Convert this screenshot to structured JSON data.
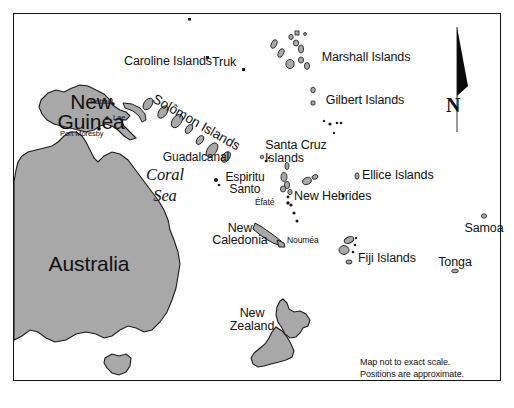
{
  "map": {
    "title_note_line1": "Map not to exact scale.",
    "title_note_line2": "Positions are approximate.",
    "compass_label": "N",
    "colors": {
      "land_fill": "#a8a8a8",
      "land_stroke": "#1a1a1a",
      "border": "#111111",
      "background": "#ffffff",
      "text": "#111111"
    },
    "sea_labels": [
      {
        "name": "coral-sea",
        "line1": "Coral",
        "line2": "Sea"
      }
    ],
    "landmasses": [
      {
        "name": "australia",
        "label": "Australia"
      },
      {
        "name": "new-guinea",
        "label_line1": "New",
        "label_line2": "Guinea"
      },
      {
        "name": "new-zealand",
        "label_line1": "New",
        "label_line2": "Zealand"
      },
      {
        "name": "new-caledonia",
        "label_line1": "New",
        "label_line2": "Caledonia"
      },
      {
        "name": "tasmania",
        "label": ""
      }
    ],
    "island_groups": [
      {
        "name": "caroline-islands",
        "label": "Caroline Islands"
      },
      {
        "name": "marshall-islands",
        "label": "Marshall Islands"
      },
      {
        "name": "gilbert-islands",
        "label": "Gilbert Islands"
      },
      {
        "name": "solomon-islands",
        "label": "Solômon Islands"
      },
      {
        "name": "santa-cruz-islands",
        "label_line1": "Santa Cruz",
        "label_line2": "Islands"
      },
      {
        "name": "ellice-islands",
        "label": "Ellice Islands"
      },
      {
        "name": "new-hebrides",
        "label": "New Hebrides"
      },
      {
        "name": "fiji-islands",
        "label": "Fiji Islands"
      },
      {
        "name": "samoa",
        "label": "Samoa"
      },
      {
        "name": "tonga",
        "label": "Tonga"
      },
      {
        "name": "espiritu-santo",
        "label_line1": "Espiritu",
        "label_line2": "Santo"
      },
      {
        "name": "guadalcanal",
        "label": "Guadalcanal"
      }
    ],
    "places": [
      {
        "name": "truk",
        "label": "Truk"
      },
      {
        "name": "rabaul",
        "label": "Rabaul"
      },
      {
        "name": "lae",
        "label": "Lae"
      },
      {
        "name": "port-moresby",
        "label": "Port Moresby"
      },
      {
        "name": "efate",
        "label": "Éfaté"
      },
      {
        "name": "noumea",
        "label": "Nouméa"
      }
    ]
  }
}
